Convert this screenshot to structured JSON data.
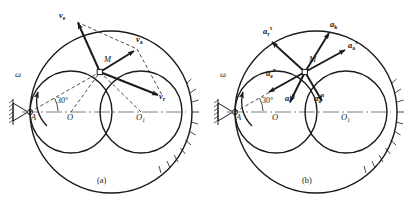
{
  "figure": {
    "caption_a": "(a)",
    "caption_b": "(b)",
    "angle_label": "30°",
    "stroke_color": "#1a1a1a",
    "axis_color": "#7a7a7a"
  },
  "panel_a": {
    "title": "velocity-diagram",
    "points": {
      "A": "A",
      "M": "M",
      "O": "O",
      "O1": "O",
      "O1_sub": "1"
    },
    "omega": "ω",
    "vectors": [
      {
        "name": "v-e",
        "base": "v",
        "sub": "e",
        "sup": "",
        "label": "ve"
      },
      {
        "name": "v-a",
        "base": "v",
        "sub": "a",
        "sup": "",
        "label": "va"
      },
      {
        "name": "v-r",
        "base": "v",
        "sub": "r",
        "sup": "",
        "label": "vr"
      }
    ]
  },
  "panel_b": {
    "title": "acceleration-diagram",
    "points": {
      "A": "A",
      "M": "M",
      "O": "O",
      "O1": "O",
      "O1_sub": "1"
    },
    "omega": "ω",
    "vectors": [
      {
        "name": "a-r-tau",
        "base": "a",
        "sub": "r",
        "sup": "τ"
      },
      {
        "name": "a-k",
        "base": "a",
        "sub": "k",
        "sup": ""
      },
      {
        "name": "a-a-tau",
        "base": "a",
        "sub": "a",
        "sup": "τ"
      },
      {
        "name": "a-e-n",
        "base": "a",
        "sub": "e",
        "sup": "n"
      },
      {
        "name": "a-r-n",
        "base": "a",
        "sub": "r",
        "sup": "n"
      },
      {
        "name": "a-a-n",
        "base": "a",
        "sub": "a",
        "sup": "n"
      }
    ]
  }
}
